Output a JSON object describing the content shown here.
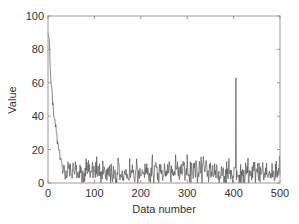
{
  "chart_data": {
    "type": "line",
    "title": "",
    "xlabel": "Data number",
    "ylabel": "Value",
    "xlim": [
      0,
      500
    ],
    "ylim": [
      0,
      100
    ],
    "xticks": [
      0,
      100,
      200,
      300,
      400,
      500
    ],
    "yticks": [
      0,
      20,
      40,
      60,
      80,
      100
    ],
    "grid": false,
    "legend": null,
    "line_color": "#555555",
    "series": [
      {
        "name": "Value",
        "description": "Rapid decay from ~90 to ~5 within first ~40 points, then noisy baseline 0-15 with occasional spikes (~17 near 225, 275, 300, 335) and a single large spike ~63 near 405",
        "x": [
          0,
          3,
          6,
          9,
          12,
          15,
          18,
          21,
          24,
          27,
          30,
          33,
          36,
          40,
          45,
          50,
          60,
          70,
          80,
          90,
          100,
          120,
          150,
          180,
          200,
          225,
          250,
          275,
          300,
          335,
          360,
          380,
          400,
          405,
          410,
          430,
          450,
          470,
          500
        ],
        "values": [
          90,
          85,
          62,
          55,
          40,
          38,
          30,
          25,
          20,
          15,
          12,
          8,
          6,
          3,
          10,
          5,
          8,
          6,
          9,
          5,
          7,
          6,
          5,
          6,
          4,
          17,
          5,
          17,
          17,
          16,
          5,
          4,
          3,
          63,
          4,
          6,
          8,
          5,
          5
        ]
      }
    ]
  },
  "axes": {
    "xlabel": "Data number",
    "ylabel": "Value",
    "xtick_labels": [
      "0",
      "100",
      "200",
      "300",
      "400",
      "500"
    ],
    "ytick_labels": [
      "0",
      "20",
      "40",
      "60",
      "80",
      "100"
    ]
  }
}
